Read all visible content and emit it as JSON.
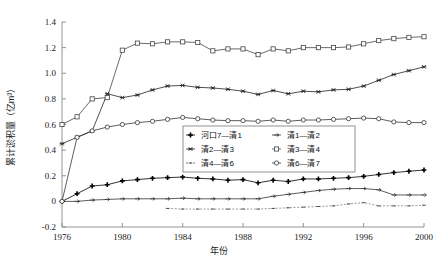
{
  "chart_data": {
    "type": "line",
    "title": "",
    "xlabel": "年份",
    "ylabel": "累计淤积量（亿m³）",
    "xlim": [
      1976,
      2000
    ],
    "ylim": [
      -0.2,
      1.4
    ],
    "xticks": [
      1976,
      1980,
      1984,
      1988,
      1992,
      1996,
      2000
    ],
    "yticks": [
      -0.2,
      0,
      0.2,
      0.4,
      0.6,
      0.8,
      1.0,
      1.2,
      1.4
    ],
    "xtick_labels": [
      "1976",
      "1980",
      "1984",
      "1988",
      "1992",
      "1996",
      "2000"
    ],
    "ytick_labels": [
      "-0.2",
      "0",
      "0.2",
      "0.4",
      "0.6",
      "0.8",
      "1.0",
      "1.2",
      "1.4"
    ],
    "grid": false,
    "legend_position": "center-right",
    "x": [
      1976,
      1977,
      1978,
      1979,
      1980,
      1981,
      1982,
      1983,
      1984,
      1985,
      1986,
      1987,
      1988,
      1989,
      1990,
      1991,
      1992,
      1993,
      1994,
      1995,
      1996,
      1997,
      1998,
      1999,
      2000
    ],
    "series": [
      {
        "name": "河口7—清1",
        "marker": "plus-filled",
        "color": "#000000",
        "values": [
          0.0,
          0.06,
          0.12,
          0.13,
          0.16,
          0.17,
          0.18,
          0.185,
          0.19,
          0.18,
          0.175,
          0.165,
          0.17,
          0.145,
          0.165,
          0.155,
          0.175,
          0.175,
          0.18,
          0.185,
          0.195,
          0.21,
          0.225,
          0.235,
          0.245
        ]
      },
      {
        "name": "清1—清2",
        "marker": "arrow-right",
        "color": "#333333",
        "values": [
          0.0,
          0.0,
          0.01,
          0.015,
          0.02,
          0.02,
          0.02,
          0.02,
          0.025,
          0.02,
          0.02,
          0.02,
          0.02,
          0.02,
          0.04,
          0.055,
          0.07,
          0.085,
          0.095,
          0.1,
          0.1,
          0.09,
          0.05,
          0.05,
          0.05
        ]
      },
      {
        "name": "清2—清3",
        "marker": "star",
        "color": "#222222",
        "values": [
          0.45,
          0.5,
          0.55,
          0.84,
          0.81,
          0.83,
          0.87,
          0.9,
          0.905,
          0.89,
          0.885,
          0.875,
          0.86,
          0.835,
          0.865,
          0.84,
          0.86,
          0.855,
          0.87,
          0.875,
          0.9,
          0.945,
          0.99,
          1.02,
          1.05
        ]
      },
      {
        "name": "清3—清4",
        "marker": "square",
        "color": "#444444",
        "values": [
          0.6,
          0.66,
          0.8,
          0.81,
          1.18,
          1.235,
          1.23,
          1.245,
          1.245,
          1.24,
          1.175,
          1.19,
          1.19,
          1.145,
          1.19,
          1.175,
          1.2,
          1.2,
          1.2,
          1.205,
          1.23,
          1.255,
          1.27,
          1.28,
          1.285
        ]
      },
      {
        "name": "清4—清6",
        "marker": "dot-small",
        "color": "#555555",
        "values": [
          null,
          null,
          null,
          null,
          null,
          null,
          null,
          -0.055,
          -0.06,
          -0.06,
          -0.06,
          -0.06,
          -0.06,
          -0.06,
          -0.055,
          -0.05,
          -0.045,
          -0.04,
          -0.035,
          -0.02,
          -0.01,
          -0.035,
          -0.035,
          -0.035,
          -0.03
        ]
      },
      {
        "name": "清6—清7",
        "marker": "circle-open",
        "color": "#333333",
        "values": [
          0.0,
          0.5,
          0.55,
          0.58,
          0.6,
          0.615,
          0.625,
          0.64,
          0.655,
          0.645,
          0.635,
          0.63,
          0.63,
          0.625,
          0.635,
          0.625,
          0.635,
          0.635,
          0.64,
          0.645,
          0.65,
          0.645,
          0.62,
          0.615,
          0.615
        ]
      }
    ]
  },
  "legend": {
    "items": [
      {
        "label": "河口7—清1"
      },
      {
        "label": "清1—清2"
      },
      {
        "label": "清2—清3"
      },
      {
        "label": "清3—清4"
      },
      {
        "label": "清4—清6"
      },
      {
        "label": "清6—清7"
      }
    ]
  }
}
